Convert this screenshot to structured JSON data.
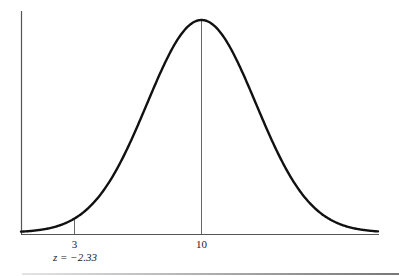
{
  "chart_data": {
    "type": "line",
    "title": "",
    "xlabel": "",
    "ylabel": "",
    "mean": 10,
    "std_dev": 3,
    "x_ticks": [
      {
        "value": 3,
        "label": "3",
        "annotation": "z = −2.33"
      },
      {
        "value": 10,
        "label": "10",
        "annotation": ""
      }
    ],
    "markers": [
      {
        "x": 3,
        "label": "3",
        "z_label": "z = −2.33"
      },
      {
        "x": 10,
        "label": "10"
      }
    ],
    "xlim": [
      1.5,
      19.5
    ],
    "grid": false,
    "legend": null
  },
  "labels": {
    "tick_3": "3",
    "tick_10": "10",
    "z_annotation": "z = −2.33"
  },
  "colors": {
    "curve": "#111111",
    "axis": "#555555",
    "marker_line": "#666666"
  }
}
